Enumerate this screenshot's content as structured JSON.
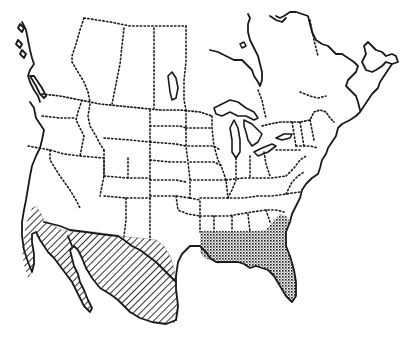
{
  "map": {
    "title": "",
    "region": "North America (Canada, United States, Mexico)",
    "style": "black-and-white line map",
    "colors": {
      "background": "#ffffff",
      "ink": "#1a1a1a",
      "hatch_fill": "#ffffff"
    },
    "range_areas": [
      {
        "id": "western-range",
        "pattern": "diagonal-hatch",
        "description": "Southwestern United States and Mexico"
      },
      {
        "id": "southeastern-range",
        "pattern": "crosshatch-stipple",
        "description": "Gulf Coast states and Florida"
      }
    ]
  }
}
